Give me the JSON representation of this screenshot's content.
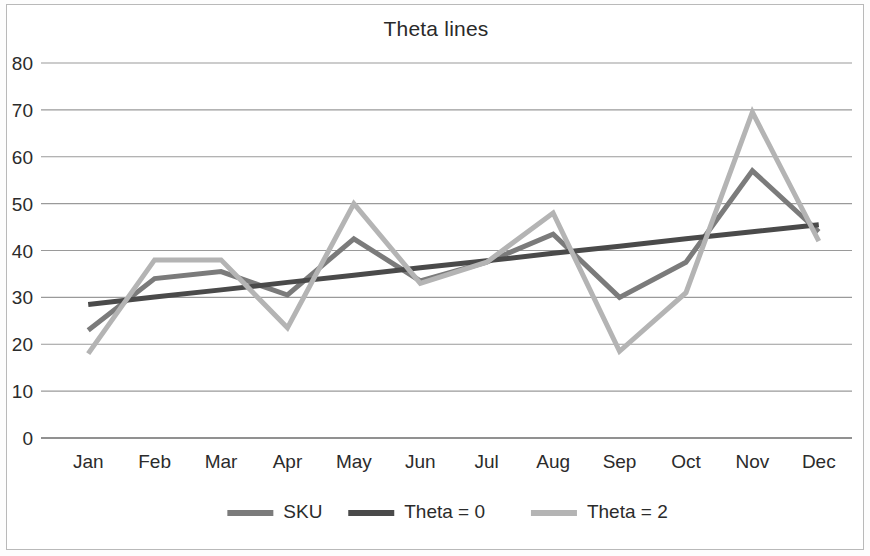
{
  "chart_data": {
    "type": "line",
    "title": "Theta lines",
    "xlabel": "",
    "ylabel": "",
    "categories": [
      "Jan",
      "Feb",
      "Mar",
      "Apr",
      "May",
      "Jun",
      "Jul",
      "Aug",
      "Sep",
      "Oct",
      "Nov",
      "Dec"
    ],
    "ylim": [
      0,
      80
    ],
    "yticks": [
      0,
      10,
      20,
      30,
      40,
      50,
      60,
      70,
      80
    ],
    "ytick_labels": [
      "0",
      "10",
      "20",
      "30",
      "40",
      "50",
      "60",
      "70",
      "80"
    ],
    "grid": true,
    "legend_position": "bottom",
    "series": [
      {
        "name": "SKU",
        "color": "#7b7b7b",
        "width": 5,
        "values": [
          23,
          34,
          35.5,
          30.5,
          42.5,
          33.5,
          37.5,
          43.5,
          30,
          37.5,
          57,
          44
        ]
      },
      {
        "name": "Theta = 0",
        "color": "#4a4a4a",
        "width": 5,
        "values": [
          28.5,
          30.1,
          31.6,
          33.2,
          34.7,
          36.3,
          37.8,
          39.4,
          40.9,
          42.5,
          44,
          45.5
        ]
      },
      {
        "name": "Theta = 2",
        "color": "#b4b4b4",
        "width": 5,
        "values": [
          18,
          38,
          38,
          23.5,
          50,
          33,
          37.5,
          48,
          18.5,
          31,
          69.5,
          42
        ]
      }
    ]
  },
  "axes": {
    "plot_left": 48,
    "plot_right": 845,
    "plot_top": 58,
    "plot_bottom": 433
  },
  "legend": {
    "entries": [
      {
        "label": "SKU",
        "color": "#7b7b7b"
      },
      {
        "label": "Theta = 0",
        "color": "#4a4a4a"
      },
      {
        "label": "Theta = 2",
        "color": "#b4b4b4"
      }
    ]
  }
}
